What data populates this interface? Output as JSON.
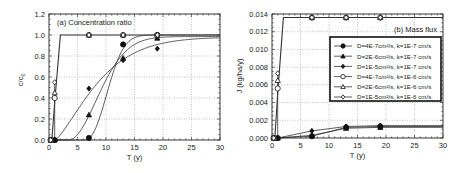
{
  "chart_data": [
    {
      "type": "line",
      "title": "(a) Concentration ratio",
      "xlabel": "T (y)",
      "ylabel": "c/c0",
      "xlim": [
        0,
        30
      ],
      "ylim": [
        0,
        1.2
      ],
      "xticks": [
        0,
        5,
        10,
        15,
        20,
        25,
        30
      ],
      "yticks": [
        0.0,
        0.2,
        0.4,
        0.6,
        0.8,
        1.0,
        1.2
      ],
      "ytick_labels": [
        "0.0",
        "0.2",
        "0.4",
        "0.6",
        "0.8",
        "1.0",
        "1.2"
      ],
      "grid": true,
      "series": [
        {
          "name": "D=4E-7cm²/s, k=1E-7 cm/s",
          "marker": "filled-circle",
          "points": [
            [
              0.3,
              0.0
            ],
            [
              1,
              0.0
            ],
            [
              7,
              0.02
            ],
            [
              13,
              0.91
            ],
            [
              19,
              1.0
            ]
          ]
        },
        {
          "name": "D=2E-6cm²/s, k=1E-7 cm/s",
          "marker": "filled-triangle",
          "points": [
            [
              0.3,
              0.0
            ],
            [
              1,
              0.0
            ],
            [
              7,
              0.24
            ],
            [
              13,
              0.78
            ],
            [
              19,
              0.97
            ]
          ]
        },
        {
          "name": "D=1E-5cm²/s, k=1E-7 cm/s",
          "marker": "filled-diamond",
          "points": [
            [
              0.3,
              0.0
            ],
            [
              1,
              0.0
            ],
            [
              7,
              0.49
            ],
            [
              13,
              0.76
            ],
            [
              19,
              0.87
            ]
          ]
        },
        {
          "name": "D=4E-7cm²/s, k=1E-6 cm/s",
          "marker": "open-circle",
          "points": [
            [
              0.3,
              0.0
            ],
            [
              1,
              0.4
            ],
            [
              7,
              1.0
            ],
            [
              13,
              1.0
            ],
            [
              19,
              1.0
            ]
          ]
        },
        {
          "name": "D=2E-6cm²/s, k=1E-6 cm/s",
          "marker": "open-triangle",
          "points": [
            [
              0.3,
              0.0
            ],
            [
              1,
              0.45
            ],
            [
              7,
              1.0
            ],
            [
              13,
              1.0
            ],
            [
              19,
              1.0
            ]
          ]
        },
        {
          "name": "D=1E-5cm²/s, k=1E-6 cm/s",
          "marker": "open-diamond",
          "points": [
            [
              0.3,
              0.0
            ],
            [
              1,
              0.55
            ],
            [
              7,
              1.0
            ],
            [
              13,
              1.0
            ],
            [
              19,
              1.0
            ]
          ]
        }
      ]
    },
    {
      "type": "line",
      "title": "(b) Mass flux",
      "xlabel": "T (y)",
      "ylabel": "J (kg/ha/y)",
      "xlim": [
        0,
        30
      ],
      "ylim": [
        0,
        0.014
      ],
      "xticks": [
        0,
        5,
        10,
        15,
        20,
        25,
        30
      ],
      "yticks": [
        0.0,
        0.002,
        0.004,
        0.006,
        0.008,
        0.01,
        0.012,
        0.014
      ],
      "ytick_labels": [
        "0.000",
        "0.002",
        "0.004",
        "0.006",
        "0.008",
        "0.010",
        "0.012",
        "0.014"
      ],
      "grid": true,
      "legend_position": "right-center",
      "series": [
        {
          "name": "D=4E-7cm²/s, k=1E-7 cm/s",
          "marker": "filled-circle",
          "points": [
            [
              0.3,
              0.0
            ],
            [
              1,
              0.0
            ],
            [
              7,
              0.0002
            ],
            [
              13,
              0.0012
            ],
            [
              19,
              0.0013
            ]
          ]
        },
        {
          "name": "D=2E-6cm²/s, k=1E-7 cm/s",
          "marker": "filled-triangle",
          "points": [
            [
              0.3,
              0.0
            ],
            [
              1,
              0.0
            ],
            [
              7,
              0.0003
            ],
            [
              13,
              0.0011
            ],
            [
              19,
              0.0012
            ]
          ]
        },
        {
          "name": "D=1E-5cm²/s, k=1E-7 cm/s",
          "marker": "filled-diamond",
          "points": [
            [
              0.3,
              0.0
            ],
            [
              1,
              0.0
            ],
            [
              7,
              0.0008
            ],
            [
              13,
              0.0013
            ],
            [
              19,
              0.0014
            ]
          ]
        },
        {
          "name": "D=4E-7cm²/s, k=1E-6 cm/s",
          "marker": "open-circle",
          "points": [
            [
              0.3,
              0.0
            ],
            [
              1,
              0.0056
            ],
            [
              7,
              0.0136
            ],
            [
              13,
              0.0136
            ],
            [
              19,
              0.0136
            ]
          ]
        },
        {
          "name": "D=2E-6cm²/s, k=1E-6 cm/s",
          "marker": "open-triangle",
          "points": [
            [
              0.3,
              0.0
            ],
            [
              1,
              0.0065
            ],
            [
              7,
              0.0136
            ],
            [
              13,
              0.0136
            ],
            [
              19,
              0.0136
            ]
          ]
        },
        {
          "name": "D=1E-5cm²/s, k=1E-6 cm/s",
          "marker": "open-diamond",
          "points": [
            [
              0.3,
              0.0
            ],
            [
              1,
              0.0073
            ],
            [
              7,
              0.0136
            ],
            [
              13,
              0.0136
            ],
            [
              19,
              0.0136
            ]
          ]
        }
      ]
    }
  ],
  "panels": {
    "a": {
      "title": "(a) Concentration ratio",
      "xlabel": "T (y)",
      "ylabel_main": "c/c",
      "ylabel_sub": "0"
    },
    "b": {
      "title": "(b) Mass flux",
      "xlabel": "T (y)",
      "ylabel": "J (kg/ha/y)"
    }
  },
  "legend": [
    "D=4E-7cm²/s, k=1E-7 cm/s",
    "D=2E-6cm²/s, k=1E-7 cm/s",
    "D=1E-5cm²/s, k=1E-7 cm/s",
    "D=4E-7cm²/s, k=1E-6 cm/s",
    "D=2E-6cm²/s, k=1E-6 cm/s",
    "D=1E-5cm²/s, k=1E-6 cm/s"
  ],
  "colors": {
    "line": "#333333",
    "grid": "#999999",
    "axis": "#222222"
  }
}
